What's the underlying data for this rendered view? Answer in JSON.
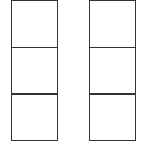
{
  "diagram": {
    "type": "grid-columns",
    "stroke_color": "#333333",
    "background": "#ffffff",
    "columns": [
      {
        "cells": [
          "",
          "",
          ""
        ]
      },
      {
        "cells": [
          "",
          "",
          ""
        ]
      }
    ]
  }
}
